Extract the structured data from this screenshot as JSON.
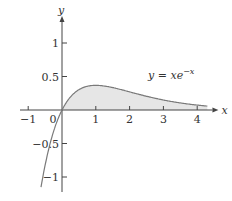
{
  "chart_data": {
    "type": "area",
    "title": "",
    "function_label": "y = xe^{-x}",
    "function_label_parts": {
      "lhs": "y = xe",
      "exp": "−x"
    },
    "xlabel": "x",
    "ylabel": "y",
    "xlim": [
      -1.2,
      4.6
    ],
    "ylim": [
      -1.25,
      1.35
    ],
    "x_ticks": [
      -1,
      1,
      2,
      3,
      4
    ],
    "x_tick_labels": [
      "−1",
      "1",
      "2",
      "3",
      "4"
    ],
    "y_ticks": [
      1,
      0.5,
      -0.5,
      -1
    ],
    "y_tick_labels": [
      "1",
      "0.5",
      "−0.5",
      "−1"
    ],
    "origin_label": "0",
    "shaded_region": {
      "from": 0,
      "to": 4.3,
      "description": "area between curve and x-axis for x >= 0"
    },
    "grid": false,
    "legend": "none",
    "series": [
      {
        "name": "y = xe^{-x}",
        "x": [
          -0.62,
          -0.5,
          -0.25,
          0,
          0.25,
          0.5,
          1,
          1.5,
          2,
          2.5,
          3,
          3.5,
          4,
          4.3
        ],
        "y": [
          -1.15,
          -0.82,
          -0.32,
          0,
          0.19,
          0.3,
          0.37,
          0.33,
          0.27,
          0.21,
          0.15,
          0.11,
          0.07,
          0.06
        ]
      }
    ],
    "colors": {
      "curve": "#7a7a7a",
      "fill": "#e6e6e6",
      "axis": "#444444"
    }
  }
}
